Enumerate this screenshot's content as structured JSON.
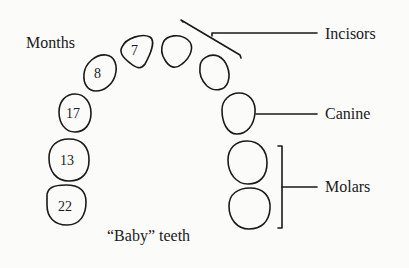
{
  "diagram": {
    "title_label": "Months",
    "caption": "“Baby” teeth",
    "labels": {
      "incisors": "Incisors",
      "canine": "Canine",
      "molars": "Molars"
    },
    "teeth": [
      {
        "id": "incisor-central",
        "months": "7"
      },
      {
        "id": "incisor-central-2",
        "months": ""
      },
      {
        "id": "incisor-lateral-right",
        "months": ""
      },
      {
        "id": "incisor-lateral",
        "months": "8"
      },
      {
        "id": "canine-right",
        "months": ""
      },
      {
        "id": "canine",
        "months": "17"
      },
      {
        "id": "molar-first-right",
        "months": ""
      },
      {
        "id": "molar-first",
        "months": "13"
      },
      {
        "id": "molar-second-right",
        "months": ""
      },
      {
        "id": "molar-second",
        "months": "22"
      }
    ],
    "colors": {
      "ink": "#1a1a1a",
      "background": "#fbfbfa"
    }
  }
}
